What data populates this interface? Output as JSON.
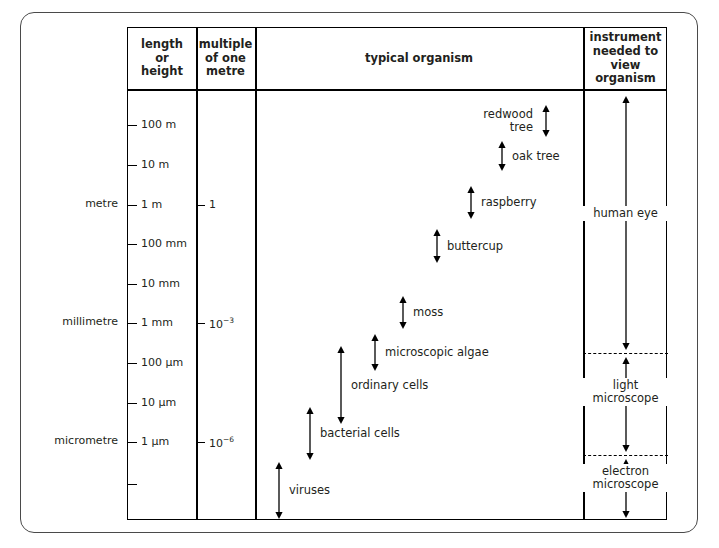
{
  "columns": [
    {
      "id": "length-or-height",
      "label": "length\nor\nheight"
    },
    {
      "id": "multiple-of-one-metre",
      "label": "multiple\nof one\nmetre"
    },
    {
      "id": "typical-organism",
      "label": "typical organism"
    },
    {
      "id": "instrument-needed",
      "label": "instrument\nneeded to\nview\norganism"
    }
  ],
  "column_headers": {
    "length_or_height": [
      "length",
      "or",
      "height"
    ],
    "multiple_of_one_metre": [
      "multiple",
      "of one",
      "metre"
    ],
    "typical_organism": "typical organism",
    "instrument_needed": [
      "instrument",
      "needed to",
      "view",
      "organism"
    ]
  },
  "unit_names": [
    {
      "label": "metre",
      "y": 204
    },
    {
      "label": "millimetre",
      "y": 322
    },
    {
      "label": "micrometre",
      "y": 441
    }
  ],
  "length_scale": [
    {
      "label": "100 m",
      "y": 124
    },
    {
      "label": "10 m",
      "y": 164
    },
    {
      "label": "1 m",
      "y": 204
    },
    {
      "label": "100 mm",
      "y": 243
    },
    {
      "label": "10 mm",
      "y": 283
    },
    {
      "label": "1 mm",
      "y": 322
    },
    {
      "label": "100 µm",
      "y": 362
    },
    {
      "label": "10 µm",
      "y": 402
    },
    {
      "label": "1 µm",
      "y": 441
    },
    {
      "label": "",
      "y": 483
    }
  ],
  "multiple_scale": [
    {
      "label": "1",
      "exponent": "",
      "y": 204
    },
    {
      "label": "10",
      "exponent": "−3",
      "y": 322
    },
    {
      "label": "10",
      "exponent": "−6",
      "y": 441
    }
  ],
  "organisms": [
    {
      "name": "redwood tree",
      "lines": [
        "redwood",
        "tree"
      ],
      "label_side": "left",
      "arrow_x": 539,
      "top": 104,
      "bottom": 136
    },
    {
      "name": "oak tree",
      "lines": [
        "oak tree"
      ],
      "label_side": "right",
      "arrow_x": 495,
      "top": 140,
      "bottom": 170
    },
    {
      "name": "raspberry",
      "lines": [
        "raspberry"
      ],
      "label_side": "right",
      "arrow_x": 464,
      "top": 185,
      "bottom": 218
    },
    {
      "name": "buttercup",
      "lines": [
        "buttercup"
      ],
      "label_side": "right",
      "arrow_x": 430,
      "top": 228,
      "bottom": 262
    },
    {
      "name": "moss",
      "lines": [
        "moss"
      ],
      "label_side": "right",
      "arrow_x": 396,
      "top": 295,
      "bottom": 328
    },
    {
      "name": "microscopic algae",
      "lines": [
        "microscopic algae"
      ],
      "label_side": "right",
      "arrow_x": 368,
      "top": 333,
      "bottom": 370
    },
    {
      "name": "ordinary cells",
      "lines": [
        "ordinary cells"
      ],
      "label_side": "right",
      "arrow_x": 334,
      "top": 345,
      "bottom": 423
    },
    {
      "name": "bacterial cells",
      "lines": [
        "bacterial cells"
      ],
      "label_side": "right",
      "arrow_x": 303,
      "top": 406,
      "bottom": 459
    },
    {
      "name": "viruses",
      "lines": [
        "viruses"
      ],
      "label_side": "right",
      "arrow_x": 272,
      "top": 461,
      "bottom": 518
    }
  ],
  "instruments": [
    {
      "name": "human eye",
      "lines": [
        "human eye"
      ],
      "arrow_x": 625,
      "top": 95,
      "bottom": 349,
      "label_y": 211
    },
    {
      "name": "light microscope",
      "lines": [
        "light",
        "microscope"
      ],
      "arrow_x": 625,
      "top": 356,
      "bottom": 451,
      "label_y": 390
    },
    {
      "name": "electron microscope",
      "lines": [
        "electron",
        "microscope"
      ],
      "arrow_x": 625,
      "top": 458,
      "bottom": 517,
      "label_y": 476
    }
  ],
  "instrument_dividers": [
    352,
    454
  ],
  "colors": {
    "line": "#000000",
    "frame": "#4a4a4a",
    "text": "#231f20",
    "background": "#ffffff"
  }
}
